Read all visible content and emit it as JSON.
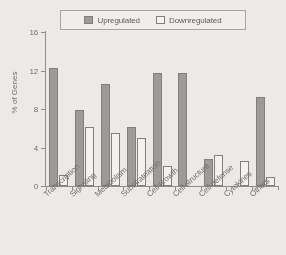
{
  "chart_data": {
    "type": "bar",
    "title": "",
    "subtitle": "",
    "xlabel": "",
    "ylabel": "% of Genes",
    "ylim": [
      0,
      17
    ],
    "yticks": [
      0,
      4,
      8,
      12,
      16
    ],
    "ytick_labels": [
      "0",
      "4",
      "8",
      "12",
      "16"
    ],
    "grid": false,
    "legend_position": "top-center",
    "categories": [
      "Transcription",
      "Signaling",
      "Metabolism",
      "Substrateation",
      "Cell growth",
      "Cell structure",
      "Cell defense",
      "Cytokines",
      "Others"
    ],
    "series": [
      {
        "name": "Upregulated",
        "color": "#9d9b99",
        "values": [
          12.3,
          7.9,
          10.6,
          6.1,
          11.7,
          11.7,
          2.8,
          0,
          9.3
        ]
      },
      {
        "name": "Downregulated",
        "color": "#faf9f8",
        "values": [
          1.1,
          6.1,
          5.5,
          5.0,
          2.1,
          0,
          3.2,
          2.6,
          0.9
        ]
      }
    ]
  },
  "legend": {
    "entries": [
      {
        "label": "Upregulated"
      },
      {
        "label": "Downregulated"
      }
    ]
  },
  "axes": {
    "y_title": "% of Genes"
  }
}
